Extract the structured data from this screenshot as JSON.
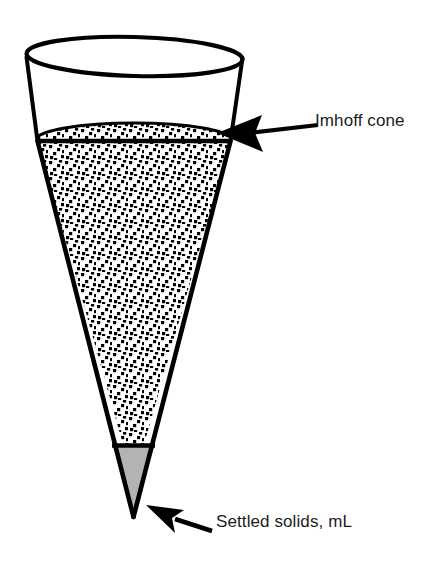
{
  "figure": {
    "background_color": "#ffffff",
    "line_color": "#000000",
    "fill_color": "#ffffff",
    "settled_solids_color": "#b3b3b3",
    "stipple_color": "#000000",
    "text_color": "#1c1c1c"
  },
  "labels": {
    "cone": "Imhoff cone",
    "settled_solids": "Settled solids, mL"
  },
  "annotations": [
    {
      "name": "imhoff-cone-callout",
      "text": "Imhoff cone",
      "arrow_direction": "left",
      "target": "cone rim at suspension surface"
    },
    {
      "name": "settled-solids-callout",
      "text": "Settled solids, mL",
      "arrow_direction": "up-left",
      "target": "cone tip"
    }
  ],
  "geometry": {
    "rim_ellipse": {
      "cx": 134,
      "cy": 56,
      "rx": 108,
      "ry": 19
    },
    "surface_line_y": 140,
    "cone_tip": {
      "x": 133,
      "y": 517
    },
    "settled_solids_top_y": 445
  }
}
